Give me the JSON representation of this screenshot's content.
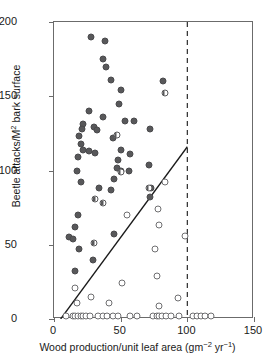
{
  "chart_data": {
    "type": "scatter",
    "title": "",
    "xlabel": "Wood production/unit leaf area (gm⁻² yr⁻¹)",
    "ylabel": "Beetle attacks/M² bark surface",
    "xlim": [
      0,
      150
    ],
    "ylim": [
      0,
      200
    ],
    "xticks": [
      0,
      50,
      100,
      150
    ],
    "yticks": [
      0,
      50,
      100,
      150,
      200
    ],
    "xtick_labels": [
      "0",
      "50",
      "100",
      "150"
    ],
    "ytick_labels": [
      "0",
      "50",
      "100",
      "150",
      "200"
    ],
    "grid": false,
    "legend": "none",
    "series": [
      {
        "name": "filled",
        "marker": "filled-circle",
        "color": "#58585a",
        "points": [
          [
            28,
            190
          ],
          [
            38,
            187
          ],
          [
            37,
            175
          ],
          [
            39,
            170
          ],
          [
            43,
            161
          ],
          [
            82,
            160
          ],
          [
            50,
            154
          ],
          [
            49,
            145
          ],
          [
            26,
            140
          ],
          [
            37,
            136
          ],
          [
            53,
            133
          ],
          [
            60,
            133
          ],
          [
            22,
            131
          ],
          [
            30,
            129
          ],
          [
            21,
            128
          ],
          [
            32,
            127
          ],
          [
            72,
            128
          ],
          [
            19,
            123
          ],
          [
            44,
            122
          ],
          [
            20,
            118
          ],
          [
            22,
            114
          ],
          [
            26,
            113
          ],
          [
            31,
            112
          ],
          [
            57,
            111
          ],
          [
            18,
            109
          ],
          [
            50,
            114
          ],
          [
            48,
            107
          ],
          [
            71,
            104
          ],
          [
            56,
            100
          ],
          [
            17,
            100
          ],
          [
            47,
            102
          ],
          [
            50,
            100
          ],
          [
            20,
            92
          ],
          [
            45,
            94
          ],
          [
            73,
            88
          ],
          [
            34,
            88
          ],
          [
            43,
            87
          ],
          [
            72,
            82
          ],
          [
            18,
            70
          ],
          [
            16,
            62
          ],
          [
            11,
            55
          ],
          [
            14,
            54
          ],
          [
            19,
            47
          ],
          [
            45,
            57
          ],
          [
            29,
            40
          ],
          [
            16,
            32
          ]
        ]
      },
      {
        "name": "half-filled",
        "marker": "half-circle",
        "color": "#58585a",
        "points": [
          [
            83,
            152
          ],
          [
            47,
            124
          ],
          [
            50,
            99
          ],
          [
            31,
            81
          ],
          [
            37,
            78
          ],
          [
            30,
            51
          ],
          [
            71,
            88
          ]
        ]
      },
      {
        "name": "open",
        "marker": "open-circle",
        "color": "#ffffff",
        "points": [
          [
            83,
            92
          ],
          [
            78,
            74
          ],
          [
            55,
            70
          ],
          [
            79,
            63
          ],
          [
            98,
            56
          ],
          [
            76,
            47
          ],
          [
            77,
            29
          ],
          [
            51,
            24
          ],
          [
            16,
            21
          ],
          [
            28,
            15
          ],
          [
            93,
            14
          ],
          [
            17,
            11
          ],
          [
            41,
            11
          ],
          [
            79,
            9
          ],
          [
            9,
            2
          ],
          [
            14,
            2
          ],
          [
            16,
            2
          ],
          [
            18,
            2
          ],
          [
            20,
            2
          ],
          [
            22,
            2
          ],
          [
            24,
            2
          ],
          [
            27,
            2
          ],
          [
            33,
            2
          ],
          [
            37,
            2
          ],
          [
            40,
            2
          ],
          [
            44,
            2
          ],
          [
            48,
            2
          ],
          [
            57,
            2
          ],
          [
            62,
            2
          ],
          [
            74,
            2
          ],
          [
            77,
            2
          ],
          [
            79,
            2
          ],
          [
            81,
            2
          ],
          [
            84,
            2
          ],
          [
            88,
            2
          ],
          [
            94,
            2
          ],
          [
            104,
            2
          ],
          [
            107,
            2
          ],
          [
            110,
            2
          ],
          [
            113,
            2
          ],
          [
            118,
            2
          ]
        ]
      }
    ],
    "fit_line": {
      "name": "regression-line",
      "style": "solid",
      "color": "#1a1a1a",
      "x0": 5,
      "y0": 0,
      "x1": 100,
      "y1": 116
    },
    "reference_line": {
      "name": "vertical-threshold",
      "style": "dashed",
      "color": "#2a2a2a",
      "x": 100
    }
  }
}
